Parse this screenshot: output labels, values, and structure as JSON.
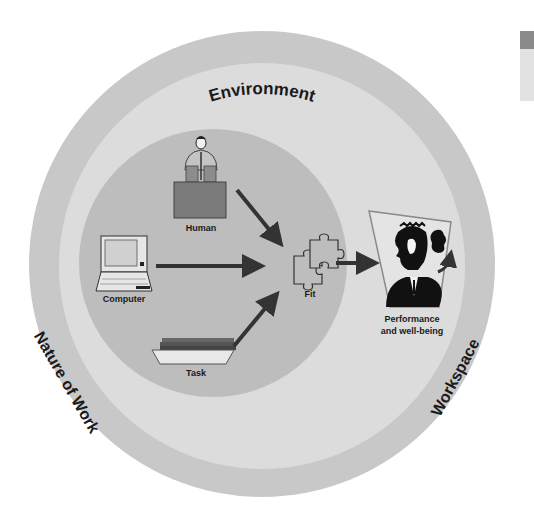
{
  "diagram": {
    "rings": {
      "outer": {
        "label": "Environment",
        "color": "#c8c8c8"
      },
      "middle": {
        "color": "#dcdcdc"
      },
      "inner": {
        "color": "#bdbdbd"
      }
    },
    "ring_labels": {
      "top": "Environment",
      "left": "Nature of Work",
      "right": "Workspace"
    },
    "nodes": {
      "human": {
        "label": "Human",
        "icon": "person-at-desk-icon"
      },
      "computer": {
        "label": "Computer",
        "icon": "laptop-icon"
      },
      "task": {
        "label": "Task",
        "icon": "paper-tray-icon"
      },
      "fit": {
        "label": "Fit",
        "icon": "puzzle-pieces-icon"
      },
      "outcome": {
        "label_line1": "Performance",
        "label_line2": "and well-being",
        "icon": "businessman-thinking-icon"
      }
    },
    "edges": [
      {
        "from": "Human",
        "to": "Fit"
      },
      {
        "from": "Computer",
        "to": "Fit"
      },
      {
        "from": "Task",
        "to": "Fit"
      },
      {
        "from": "Fit",
        "to": "Performance and well-being"
      }
    ],
    "colors": {
      "arrow": "#333333",
      "text": "#1a1a1a",
      "frame": "#8a8a8a"
    }
  }
}
